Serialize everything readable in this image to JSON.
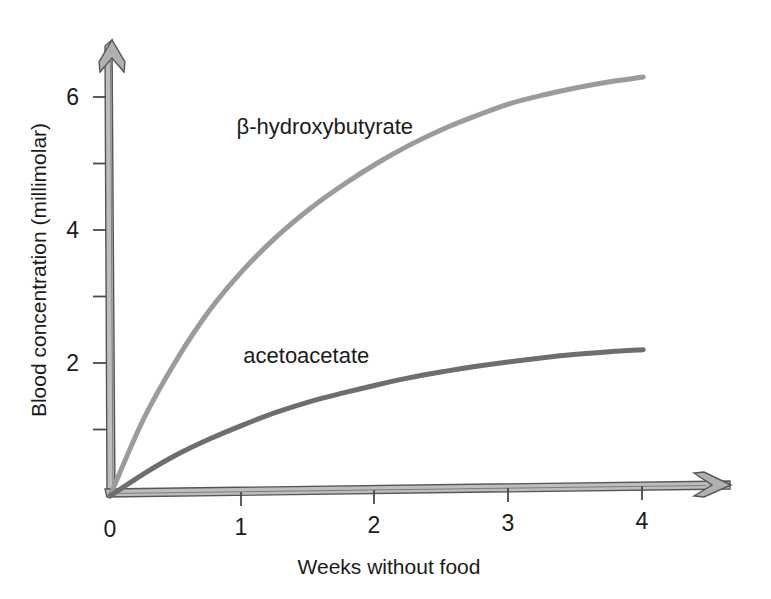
{
  "chart_data": {
    "type": "line",
    "title": "",
    "subtitle": "",
    "xlabel": "Weeks without food",
    "ylabel": "Blood concentration (millimolar)",
    "xlim": [
      0,
      4.4
    ],
    "ylim": [
      0,
      6.8
    ],
    "grid": false,
    "legend_position": "inline-annotations",
    "x_ticks": [
      0,
      1,
      2,
      3,
      4
    ],
    "x_tick_labels": [
      "0",
      "1",
      "2",
      "3",
      "4"
    ],
    "y_ticks": [
      1,
      2,
      3,
      4,
      5,
      6
    ],
    "y_tick_labels": [
      "",
      "2",
      "",
      "4",
      "",
      "6"
    ],
    "x": [
      0,
      0.25,
      0.5,
      0.75,
      1,
      1.25,
      1.5,
      1.75,
      2,
      2.25,
      2.5,
      2.75,
      3,
      3.25,
      3.5,
      3.75,
      4
    ],
    "series": [
      {
        "name": "β-hydroxybutyrate",
        "color": "#9b9b9b",
        "values": [
          0,
          1.15,
          2.05,
          2.8,
          3.4,
          3.9,
          4.32,
          4.68,
          5.0,
          5.28,
          5.52,
          5.72,
          5.9,
          6.03,
          6.14,
          6.23,
          6.3
        ],
        "annotation": {
          "text": "β-hydroxybutyrate",
          "x": 0.95,
          "y": 5.45
        }
      },
      {
        "name": "acetoacetate",
        "color": "#6e6e6e",
        "values": [
          0,
          0.33,
          0.62,
          0.86,
          1.07,
          1.26,
          1.42,
          1.55,
          1.67,
          1.78,
          1.87,
          1.95,
          2.02,
          2.08,
          2.13,
          2.17,
          2.2
        ],
        "annotation": {
          "text": "acetoacetate",
          "x": 1.0,
          "y": 2.0
        }
      }
    ]
  },
  "axes": {
    "y_axis_title": "Blood concentration (millimolar)",
    "x_axis_title": "Weeks without food",
    "axis_color": "#5e5e5e",
    "axis_fill": "#b4b4b4"
  },
  "labels": {
    "beta_hydroxybutyrate": "β-hydroxybutyrate",
    "acetoacetate": "acetoacetate",
    "y2": "2",
    "y4": "4",
    "y6": "6",
    "x0": "0",
    "x1": "1",
    "x2": "2",
    "x3": "3",
    "x4": "4"
  }
}
